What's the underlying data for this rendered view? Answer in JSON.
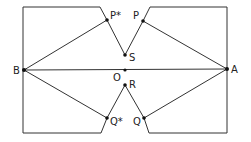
{
  "diagram": {
    "points": {
      "A": {
        "label": "A",
        "x": 227,
        "y": 69
      },
      "B": {
        "label": "B",
        "x": 24,
        "y": 70
      },
      "O": {
        "label": "O",
        "x": 125,
        "y": 70
      },
      "S": {
        "label": "S",
        "x": 125,
        "y": 55
      },
      "R": {
        "label": "R",
        "x": 125,
        "y": 85
      },
      "P": {
        "label": "P",
        "x": 143,
        "y": 21
      },
      "P_star": {
        "label": "P*",
        "x": 107,
        "y": 20
      },
      "Q": {
        "label": "Q",
        "x": 144,
        "y": 118
      },
      "Q_star": {
        "label": "Q*",
        "x": 107,
        "y": 118
      }
    },
    "segments": [
      [
        "B",
        "A"
      ],
      [
        "B",
        "P*"
      ],
      [
        "B",
        "Q*"
      ],
      [
        "A",
        "P"
      ],
      [
        "A",
        "Q"
      ],
      [
        "P*",
        "S"
      ],
      [
        "P",
        "S"
      ],
      [
        "Q*",
        "R"
      ],
      [
        "Q",
        "R"
      ]
    ],
    "boundary": "rectangle with V-shaped notches at top and bottom center"
  }
}
